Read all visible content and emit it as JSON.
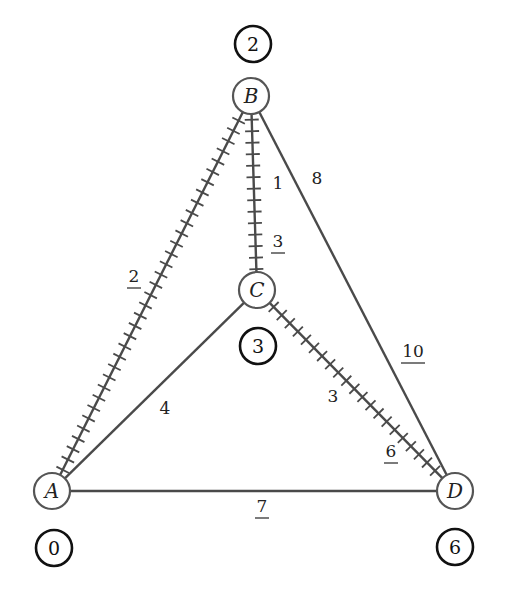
{
  "diagram": {
    "type": "weighted-graph-shortest-path",
    "colors": {
      "edge": "#4a4a4a",
      "node_stroke": "#555555",
      "distance_stroke": "#111111",
      "background": "#ffffff"
    },
    "nodes": [
      {
        "id": "A",
        "label": "A",
        "x": 52,
        "y": 491,
        "distance": "0",
        "dist_x": 54,
        "dist_y": 548
      },
      {
        "id": "B",
        "label": "B",
        "x": 251,
        "y": 96,
        "distance": "2",
        "dist_x": 253,
        "dist_y": 44
      },
      {
        "id": "C",
        "label": "C",
        "x": 257,
        "y": 290,
        "distance": "3",
        "dist_x": 258,
        "dist_y": 346
      },
      {
        "id": "D",
        "label": "D",
        "x": 455,
        "y": 491,
        "distance": "6",
        "dist_x": 455,
        "dist_y": 547
      }
    ],
    "edges": [
      {
        "from": "A",
        "to": "B",
        "hatched": true,
        "labels": [
          {
            "text": "2",
            "underlined": true,
            "x": 134,
            "y": 282
          }
        ]
      },
      {
        "from": "B",
        "to": "C",
        "hatched": true,
        "labels": [
          {
            "text": "1",
            "underlined": false,
            "x": 278,
            "y": 189
          },
          {
            "text": "3",
            "underlined": true,
            "x": 278,
            "y": 247
          }
        ]
      },
      {
        "from": "B",
        "to": "D",
        "hatched": false,
        "labels": [
          {
            "text": "8",
            "underlined": false,
            "x": 317,
            "y": 184
          },
          {
            "text": "10",
            "underlined": true,
            "x": 413,
            "y": 357
          }
        ]
      },
      {
        "from": "A",
        "to": "C",
        "hatched": false,
        "labels": [
          {
            "text": "4",
            "underlined": false,
            "x": 165,
            "y": 414
          }
        ]
      },
      {
        "from": "C",
        "to": "D",
        "hatched": true,
        "labels": [
          {
            "text": "3",
            "underlined": false,
            "x": 333,
            "y": 402
          },
          {
            "text": "6",
            "underlined": true,
            "x": 391,
            "y": 457
          }
        ]
      },
      {
        "from": "A",
        "to": "D",
        "hatched": false,
        "labels": [
          {
            "text": "7",
            "underlined": true,
            "x": 262,
            "y": 512
          }
        ]
      }
    ]
  }
}
